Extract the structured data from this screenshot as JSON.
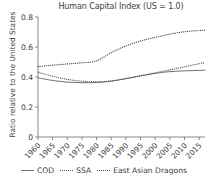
{
  "chart_data": {
    "type": "line",
    "title": "Human Capital Index (US = 1.0)",
    "xlabel": "",
    "ylabel": "Ratio relative to the United States",
    "xlim": [
      1960,
      2017
    ],
    "ylim": [
      0,
      0.8
    ],
    "grid": false,
    "legend_position": "bottom",
    "xticks": [
      "1960",
      "1965",
      "1970",
      "1975",
      "1980",
      "1985",
      "1990",
      "1995",
      "2000",
      "2005",
      "2010",
      "2015"
    ],
    "yticks": [
      "0",
      "0.2",
      "0.4",
      "0.6",
      "0.8"
    ],
    "x": [
      1960,
      1965,
      1970,
      1975,
      1980,
      1985,
      1990,
      1995,
      2000,
      2005,
      2010,
      2015,
      2017
    ],
    "series": [
      {
        "name": "COD",
        "style": "solid",
        "color": "#6f6f6f",
        "values": [
          0.395,
          0.377,
          0.366,
          0.362,
          0.363,
          0.372,
          0.389,
          0.407,
          0.424,
          0.436,
          0.441,
          0.444,
          0.445
        ]
      },
      {
        "name": "SSA",
        "style": "dotted",
        "color": "#5a5a5a",
        "values": [
          0.432,
          0.405,
          0.384,
          0.372,
          0.369,
          0.374,
          0.39,
          0.409,
          0.428,
          0.448,
          0.468,
          0.489,
          0.497
        ]
      },
      {
        "name": "East Asian Dragons",
        "style": "dotted",
        "color": "#4a4a4a",
        "values": [
          0.47,
          0.479,
          0.487,
          0.495,
          0.508,
          0.562,
          0.607,
          0.64,
          0.664,
          0.686,
          0.702,
          0.71,
          0.712
        ]
      }
    ]
  },
  "legend": {
    "entries": [
      {
        "label": "COD"
      },
      {
        "label": "SSA"
      },
      {
        "label": "East Asian Dragons"
      }
    ]
  }
}
